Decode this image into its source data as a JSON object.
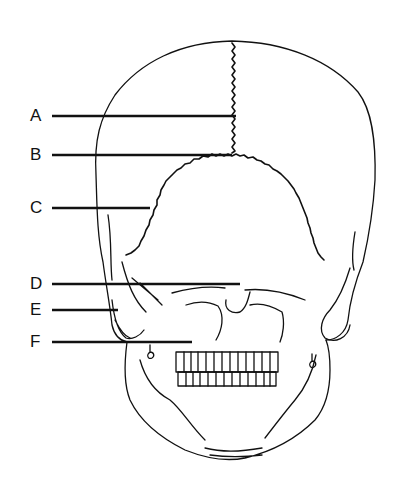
{
  "figure": {
    "labels": [
      {
        "letter": "A",
        "y": 116
      },
      {
        "letter": "B",
        "y": 155
      },
      {
        "letter": "C",
        "y": 208
      },
      {
        "letter": "D",
        "y": 284
      },
      {
        "letter": "E",
        "y": 310
      },
      {
        "letter": "F",
        "y": 342
      }
    ],
    "colors": {
      "line": "#111111",
      "background": "#ffffff"
    }
  }
}
